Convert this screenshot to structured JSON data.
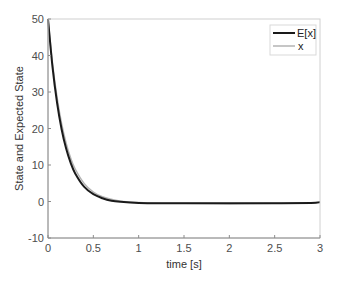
{
  "chart_data": {
    "type": "line",
    "title": "",
    "xlabel": "time [s]",
    "ylabel": "State and Expected State",
    "xlim": [
      0,
      3
    ],
    "ylim": [
      -10,
      50
    ],
    "xticks": [
      0,
      0.5,
      1,
      1.5,
      2,
      2.5,
      3
    ],
    "xtick_labels": [
      "0",
      "0.5",
      "1",
      "1.5",
      "2",
      "2.5",
      "3"
    ],
    "yticks": [
      -10,
      0,
      10,
      20,
      30,
      40,
      50
    ],
    "ytick_labels": [
      "-10",
      "0",
      "10",
      "20",
      "30",
      "40",
      "50"
    ],
    "grid": false,
    "legend_position": "upper right",
    "x": [
      0,
      0.05,
      0.1,
      0.15,
      0.2,
      0.25,
      0.3,
      0.4,
      0.5,
      0.6,
      0.7,
      0.8,
      1.0,
      1.25,
      1.5,
      2.0,
      2.5,
      2.9,
      3.0
    ],
    "series": [
      {
        "name": "E[x]",
        "color": "#1a1a1a",
        "line_width": 2,
        "values": [
          50,
          36.8,
          27.0,
          19.8,
          14.5,
          10.6,
          7.7,
          4.0,
          2.0,
          0.9,
          0.2,
          -0.1,
          -0.4,
          -0.5,
          -0.5,
          -0.5,
          -0.5,
          -0.4,
          -0.2
        ]
      },
      {
        "name": "x",
        "color": "#b3b3b3",
        "line_width": 1.5,
        "values": [
          50,
          37.8,
          28.5,
          21.3,
          16.0,
          11.9,
          8.9,
          4.9,
          2.6,
          1.3,
          0.6,
          0.1,
          -0.3,
          -0.5,
          -0.5,
          -0.6,
          -0.5,
          -0.4,
          -0.1
        ]
      }
    ]
  },
  "legend": {
    "items": [
      {
        "label": "E[x]",
        "color": "#1a1a1a"
      },
      {
        "label": "x",
        "color": "#b3b3b3"
      }
    ]
  }
}
